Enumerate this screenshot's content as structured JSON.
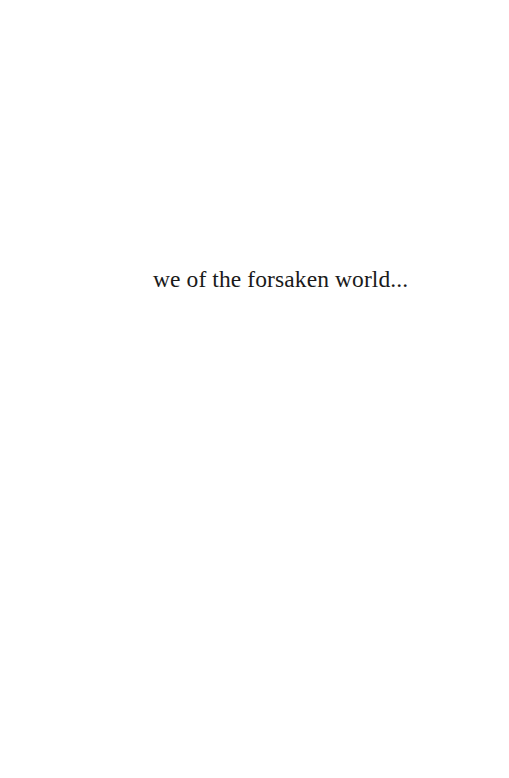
{
  "page": {
    "epigraph": "we of the forsaken world...",
    "colors": {
      "background": "#ffffff",
      "text": "#1a1a1a"
    }
  }
}
